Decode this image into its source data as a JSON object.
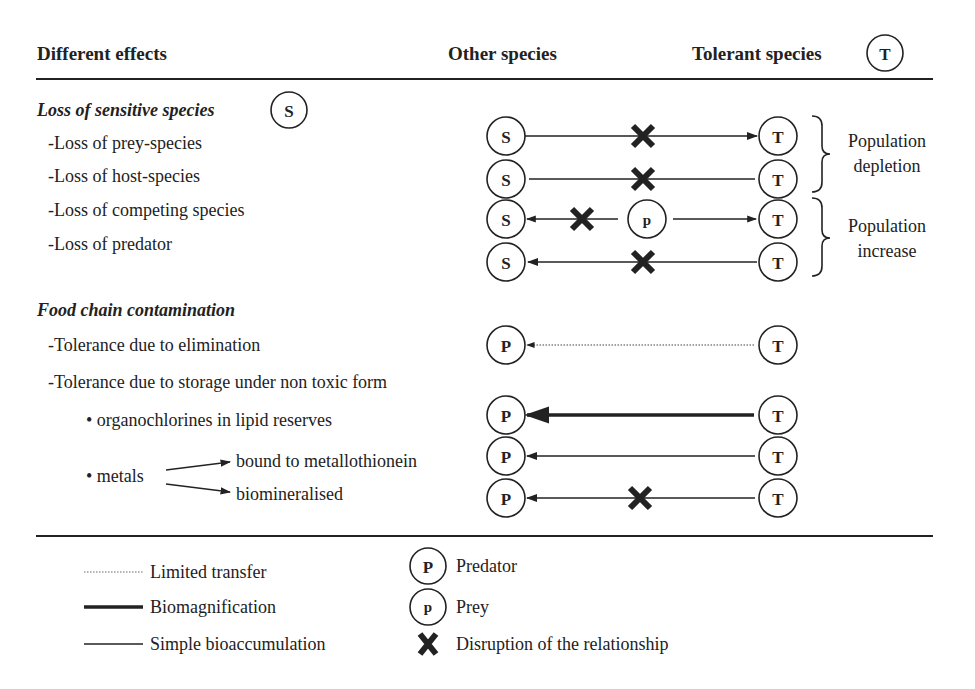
{
  "header": {
    "col1": "Different effects",
    "col2": "Other species",
    "col3": "Tolerant species",
    "col3_symbol": "T"
  },
  "section1": {
    "title": "Loss of sensitive species",
    "symbol": "S",
    "items": [
      "-Loss of prey-species",
      "-Loss of host-species",
      "-Loss of competing species",
      "-Loss of predator"
    ],
    "braces": [
      {
        "line1": "Population",
        "line2": "depletion"
      },
      {
        "line1": "Population",
        "line2": "increase"
      }
    ]
  },
  "section2": {
    "title": "Food chain contamination",
    "items": [
      "-Tolerance due to elimination",
      "-Tolerance due to storage under non toxic form",
      "• organochlorines in lipid reserves",
      "• metals"
    ],
    "metals_branches": [
      "bound to metallothionein",
      "biomineralised"
    ]
  },
  "symbols": {
    "sensitive": "S",
    "tolerant": "T",
    "predator": "P",
    "prey": "p"
  },
  "legend": {
    "lines": [
      {
        "style": "dotted",
        "label": "Limited transfer"
      },
      {
        "style": "thick",
        "label": "Biomagnification"
      },
      {
        "style": "thin",
        "label": "Simple bioaccumulation"
      }
    ],
    "symbols": [
      {
        "symbol": "P",
        "label": "Predator"
      },
      {
        "symbol": "p",
        "label": "Prey"
      },
      {
        "symbol": "X",
        "label": "Disruption of the relationship"
      }
    ]
  },
  "colors": {
    "ink": "#222222",
    "background": "#ffffff"
  }
}
